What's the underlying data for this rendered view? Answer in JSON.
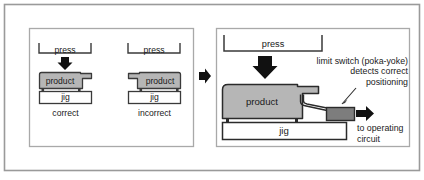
{
  "figure": {
    "background_color": "#ffffff",
    "outer_border_color": "#9a9a9a",
    "inner_border_color": "#9a9a9a",
    "line_color": "#2b2b2b",
    "product_fill": "#b6b6b6",
    "switch_fill": "#7d7d7d",
    "jig_fill": "#ffffff",
    "arrow_color": "#111111"
  },
  "left_panel": {
    "name": "before-improvement",
    "cases": [
      {
        "id": "correct",
        "press_label": "press",
        "product_label": "product",
        "jig_label": "jig",
        "caption": "correct",
        "orientation": "notch-right",
        "press_arrow": "down-arrow-icon",
        "has_press_arrow": true
      },
      {
        "id": "incorrect",
        "press_label": "press",
        "product_label": "product",
        "jig_label": "jig",
        "caption": "incorrect",
        "orientation": "notch-left",
        "press_arrow": "down-arrow-icon",
        "has_press_arrow": false
      }
    ]
  },
  "transition": {
    "icon": "right-arrow-icon",
    "label": ""
  },
  "right_panel": {
    "name": "after-improvement",
    "press_label": "press",
    "product_label": "product",
    "jig_label": "jig",
    "press_arrow": "down-arrow-icon",
    "annotation": {
      "line1": "limit switch (poka-yoke)",
      "line2": "detects correct",
      "line3": "positioning",
      "leader": "leader-line"
    },
    "output": {
      "arrow": "right-arrow-icon",
      "line1": "to operating",
      "line2": "circuit"
    }
  }
}
